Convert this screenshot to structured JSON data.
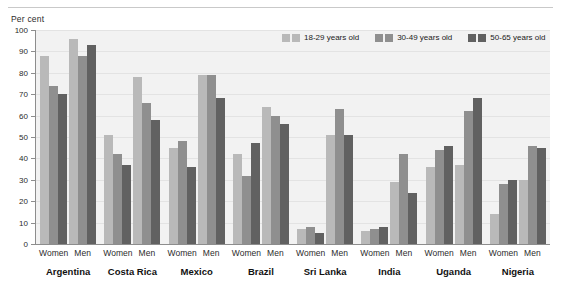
{
  "axis_unit_label": "Per cent",
  "legend": {
    "items": [
      {
        "label": "18-29 years old",
        "color": "#b9b9b9"
      },
      {
        "label": "30-49 years old",
        "color": "#8f8f8f"
      },
      {
        "label": "50-65 years old",
        "color": "#616161"
      }
    ]
  },
  "sub_labels": {
    "women": "Women",
    "men": "Men"
  },
  "chart_data": {
    "type": "bar",
    "title": "",
    "subtitle": "",
    "xlabel": "",
    "ylabel": "Per cent",
    "ylim": [
      0,
      100
    ],
    "yticks": [
      0,
      10,
      20,
      30,
      40,
      50,
      60,
      70,
      80,
      90,
      100
    ],
    "ytick_labels": [
      "0",
      "10",
      "20",
      "30",
      "40",
      "50",
      "60",
      "70",
      "80",
      "90",
      "100"
    ],
    "grid": true,
    "legend_position": "top-right",
    "categories": [
      "Argentina",
      "Costa Rica",
      "Mexico",
      "Brazil",
      "Sri Lanka",
      "India",
      "Uganda",
      "Nigeria"
    ],
    "subcategories": [
      "Women",
      "Men"
    ],
    "series": [
      {
        "name": "18-29 years old",
        "color": "#b9b9b9"
      },
      {
        "name": "30-49 years old",
        "color": "#8f8f8f"
      },
      {
        "name": "50-65 years old",
        "color": "#616161"
      }
    ],
    "groups": [
      {
        "category": "Argentina",
        "Women": {
          "18-29 years old": 88,
          "30-49 years old": 74,
          "50-65 years old": 70
        },
        "Men": {
          "18-29 years old": 96,
          "30-49 years old": 88,
          "50-65 years old": 93
        }
      },
      {
        "category": "Costa Rica",
        "Women": {
          "18-29 years old": 51,
          "30-49 years old": 42,
          "50-65 years old": 37
        },
        "Men": {
          "18-29 years old": 78,
          "30-49 years old": 66,
          "50-65 years old": 58
        }
      },
      {
        "category": "Mexico",
        "Women": {
          "18-29 years old": 45,
          "30-49 years old": 48,
          "50-65 years old": 36
        },
        "Men": {
          "18-29 years old": 79,
          "30-49 years old": 79,
          "50-65 years old": 68
        }
      },
      {
        "category": "Brazil",
        "Women": {
          "18-29 years old": 42,
          "30-49 years old": 32,
          "50-65 years old": 47
        },
        "Men": {
          "18-29 years old": 64,
          "30-49 years old": 60,
          "50-65 years old": 56
        }
      },
      {
        "category": "Sri Lanka",
        "Women": {
          "18-29 years old": 7,
          "30-49 years old": 8,
          "50-65 years old": 5
        },
        "Men": {
          "18-29 years old": 51,
          "30-49 years old": 63,
          "50-65 years old": 51
        }
      },
      {
        "category": "India",
        "Women": {
          "18-29 years old": 6,
          "30-49 years old": 7,
          "50-65 years old": 8
        },
        "Men": {
          "18-29 years old": 29,
          "30-49 years old": 42,
          "50-65 years old": 24
        }
      },
      {
        "category": "Uganda",
        "Women": {
          "18-29 years old": 36,
          "30-49 years old": 44,
          "50-65 years old": 46
        },
        "Men": {
          "18-29 years old": 37,
          "30-49 years old": 62,
          "50-65 years old": 68
        }
      },
      {
        "category": "Nigeria",
        "Women": {
          "18-29 years old": 14,
          "30-49 years old": 28,
          "50-65 years old": 30
        },
        "Men": {
          "18-29 years old": 30,
          "30-49 years old": 46,
          "50-65 years old": 45
        }
      }
    ]
  }
}
